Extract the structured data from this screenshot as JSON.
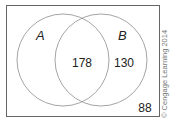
{
  "diagram": {
    "type": "venn",
    "sets": [
      {
        "name": "A",
        "label": "A"
      },
      {
        "name": "B",
        "label": "B"
      }
    ],
    "regions": {
      "a_only": "",
      "a_and_b": "178",
      "b_only": "130",
      "outside": "88"
    },
    "colors": {
      "stroke": "#9a9a9a",
      "box": "#666666",
      "text": "#222222"
    }
  },
  "copyright": "© Cengage Learning 2014"
}
